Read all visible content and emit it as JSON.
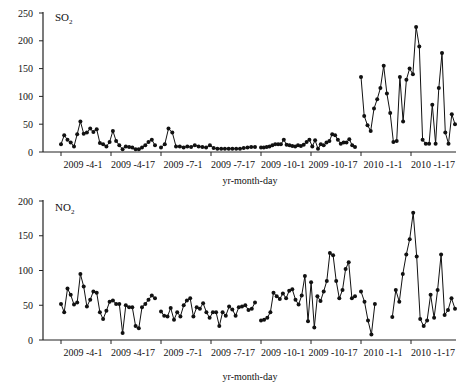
{
  "chart_data": [
    {
      "type": "line",
      "title": "",
      "series_label": "SO",
      "series_label_sub": "2",
      "xlabel": "yr-month-day",
      "ylabel": "",
      "ylim": [
        0,
        250
      ],
      "yticks": [
        0,
        50,
        100,
        150,
        200,
        250
      ],
      "xticks": [
        "2009 -4-1",
        "2009 -4-17",
        "2009 -7-1",
        "2009 -7-17",
        "2009 -10-1",
        "2009 -10-17",
        "2010 -1-1",
        "2010 -1-17"
      ],
      "grid": false,
      "legend": "none",
      "segments": [
        {
          "period": "2009-4",
          "start_tick": 0,
          "values": [
            14,
            30,
            22,
            17,
            10,
            32,
            55,
            33,
            35,
            42,
            36,
            41,
            16,
            14,
            10,
            18,
            38,
            20,
            12,
            5,
            10,
            9,
            8,
            5,
            5,
            8,
            12,
            18,
            22,
            12
          ]
        },
        {
          "period": "2009-7",
          "start_tick": 2,
          "values": [
            8,
            14,
            42,
            35,
            10,
            10,
            8,
            10,
            9,
            12,
            10,
            9,
            8,
            12,
            7,
            6,
            6,
            6,
            6,
            6,
            6,
            6,
            7,
            8,
            9,
            9
          ]
        },
        {
          "period": "2009-10",
          "start_tick": 4,
          "values": [
            8,
            8,
            9,
            10,
            12,
            14,
            14,
            14,
            22,
            13,
            12,
            11,
            10,
            12,
            11,
            13,
            18,
            22,
            10,
            21,
            6,
            14,
            12,
            17,
            20,
            32,
            30,
            22,
            15,
            17,
            17,
            23,
            12,
            9
          ]
        },
        {
          "period": "2010-1",
          "start_tick": 6,
          "values": [
            135,
            65,
            48,
            38,
            78,
            95,
            115,
            155,
            105,
            70,
            18,
            20,
            135,
            55,
            130,
            150,
            140,
            225,
            190,
            22,
            15,
            15,
            85,
            15,
            115,
            178,
            35,
            15,
            68,
            50
          ]
        }
      ]
    },
    {
      "type": "line",
      "title": "",
      "series_label": "NO",
      "series_label_sub": "2",
      "xlabel": "yr-month-day",
      "ylabel": "",
      "ylim": [
        0,
        200
      ],
      "yticks": [
        0,
        50,
        100,
        150,
        200
      ],
      "xticks": [
        "2009 -4-1",
        "2009 -4-17",
        "2009 -7-1",
        "2009 -7-17",
        "2009 -10-1",
        "2009 -10-17",
        "2010 -1-1",
        "2010 -1-17"
      ],
      "grid": false,
      "legend": "none",
      "segments": [
        {
          "period": "2009-4",
          "start_tick": 0,
          "values": [
            52,
            40,
            74,
            65,
            51,
            54,
            95,
            77,
            48,
            58,
            70,
            68,
            40,
            30,
            42,
            55,
            57,
            52,
            52,
            10,
            50,
            47,
            47,
            20,
            17,
            47,
            52,
            58,
            64,
            60
          ]
        },
        {
          "period": "2009-7",
          "start_tick": 2,
          "values": [
            41,
            35,
            34,
            46,
            29,
            40,
            34,
            50,
            57,
            60,
            34,
            47,
            45,
            53,
            40,
            32,
            40,
            40,
            20,
            40,
            35,
            48,
            44,
            35,
            47,
            48,
            50,
            43,
            45,
            54
          ]
        },
        {
          "period": "2009-10",
          "start_tick": 4,
          "values": [
            28,
            29,
            32,
            40,
            68,
            63,
            59,
            67,
            60,
            71,
            73,
            58,
            51,
            64,
            92,
            27,
            83,
            18,
            63,
            56,
            70,
            85,
            125,
            122,
            85,
            60,
            72,
            102,
            112,
            60,
            63
          ]
        },
        {
          "period": "2010-1",
          "start_tick": 6,
          "values": [
            70,
            55,
            28,
            8,
            52,
            null,
            null,
            null,
            null,
            33,
            72,
            55,
            95,
            123,
            145,
            183,
            120,
            30,
            20,
            28,
            65,
            32,
            72,
            123,
            36,
            43,
            60,
            45
          ]
        }
      ]
    }
  ],
  "panels": {
    "top": {
      "label_main": "SO",
      "label_sub": "2",
      "xlabel": "yr-month-day",
      "yticks": [
        "0",
        "50",
        "100",
        "150",
        "200",
        "250"
      ],
      "xticks": [
        "2009 -4-1",
        "2009 -4-17",
        "2009 -7-1",
        "2009 -7-17",
        "2009 -10-1",
        "2009 -10-17",
        "2010 -1-1",
        "2010 -1-17"
      ]
    },
    "bottom": {
      "label_main": "NO",
      "label_sub": "2",
      "xlabel": "yr-month-day",
      "yticks": [
        "0",
        "50",
        "100",
        "150",
        "200"
      ],
      "xticks": [
        "2009 -4-1",
        "2009 -4-17",
        "2009 -7-1",
        "2009 -7-17",
        "2009 -10-1",
        "2009 -10-17",
        "2010 -1-1",
        "2010 -1-17"
      ]
    }
  },
  "colors": {
    "line": "#111111",
    "marker": "#111111",
    "axis": "#222222"
  }
}
